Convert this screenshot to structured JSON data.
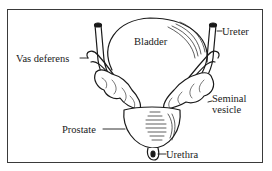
{
  "diagram": {
    "labels": {
      "bladder": "Bladder",
      "ureter": "Ureter",
      "vas_deferens": "Vas deferens",
      "seminal_vesicle_line1": "Seminal",
      "seminal_vesicle_line2": "vesicle",
      "prostate": "Prostate",
      "urethra": "Urethra"
    },
    "colors": {
      "ink": "#1a1a1a",
      "frame": "#3a3a3a",
      "background": "#ffffff"
    }
  }
}
